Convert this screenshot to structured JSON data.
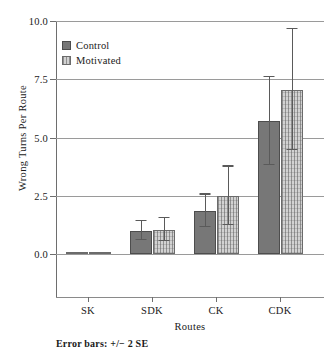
{
  "chart_data": {
    "type": "bar",
    "title": "",
    "xlabel": "Routes",
    "ylabel": "Wrong Turns Per Route",
    "categories": [
      "SK",
      "SDK",
      "CK",
      "CDK"
    ],
    "ylim": [
      0.0,
      10.0
    ],
    "ytick_labels": [
      "0.0",
      "2.5",
      "5.0",
      "7.5",
      "10.0"
    ],
    "ytick_values": [
      0.0,
      2.5,
      5.0,
      7.5,
      10.0
    ],
    "grid": true,
    "legend_position": "top-left",
    "annotation": "Error bars: +/− 2 SE",
    "series": [
      {
        "name": "Control",
        "color": "#777777",
        "fill": "solid",
        "values": [
          0.0,
          1.0,
          1.85,
          5.7
        ],
        "errors": [
          0.0,
          0.4,
          0.7,
          1.9
        ]
      },
      {
        "name": "Motivated",
        "color": "#d2d2d2",
        "fill": "hatched",
        "values": [
          0.0,
          1.05,
          2.5,
          7.05
        ],
        "errors": [
          0.0,
          0.5,
          1.25,
          2.6
        ]
      }
    ]
  },
  "axis": {
    "y_label": "Wrong Turns Per Route",
    "x_label": "Routes"
  },
  "legend": {
    "items": [
      {
        "label": "Control"
      },
      {
        "label": "Motivated"
      }
    ]
  },
  "footnote": {
    "text": "Error bars: +/− 2 SE"
  },
  "colors": {
    "control": "#777777",
    "motivated": "#d2d2d2",
    "axis": "#6e6e6e",
    "grid": "#9a9a9a",
    "error": "#5a5a5a"
  }
}
